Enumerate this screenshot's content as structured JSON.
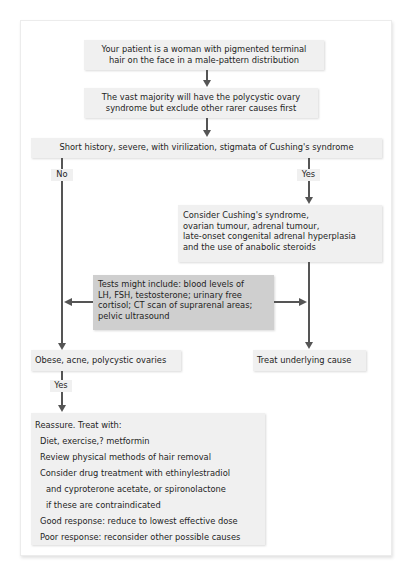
{
  "flowchart": {
    "start": {
      "lines": [
        "Your patient is a woman with pigmented terminal",
        "hair on the face in a male-pattern distribution"
      ]
    },
    "note": {
      "lines": [
        "The vast majority will have the polycystic ovary",
        "syndrome but exclude other rarer causes first"
      ]
    },
    "decision": {
      "text": "Short history, severe, with virilization, stigmata of Cushing's syndrome"
    },
    "branch_no": {
      "label": "No"
    },
    "branch_yes": {
      "label": "Yes"
    },
    "consider": {
      "lines": [
        "Consider Cushing's syndrome,",
        "ovarian tumour, adrenal tumour,",
        "late-onset congenital adrenal hyperplasia",
        "and the use of anabolic steroids"
      ]
    },
    "tests": {
      "lines": [
        "Tests might include: blood levels of",
        "LH, FSH, testosterone; urinary free",
        "cortisol; CT scan of suprarenal areas;",
        "pelvic ultrasound"
      ]
    },
    "obese": {
      "text": "Obese, acne, polycystic ovaries"
    },
    "treat_cause": {
      "text": "Treat underlying cause"
    },
    "branch_yes2": {
      "label": "Yes"
    },
    "reassure": {
      "title": "Reassure. Treat with:",
      "items": [
        "Diet, exercise,? metformin",
        "Review physical methods of hair removal",
        "Consider drug treatment with ethinylestradiol",
        "and cyproterone acetate, or spironolactone",
        "if these are contraindicated",
        "Good response: reduce to lowest effective dose",
        "Poor response: reconsider other possible causes"
      ]
    },
    "colors": {
      "box": "#f0f0f0",
      "tests_box": "#cfcfcf",
      "arrow": "#555555"
    }
  }
}
